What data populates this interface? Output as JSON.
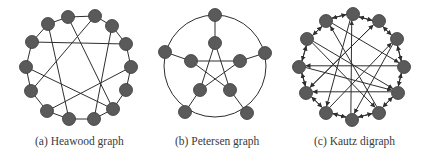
{
  "figure": {
    "panels": [
      {
        "id": "a",
        "caption": "(a)  Heawood graph",
        "graph": "Heawood graph",
        "node_count": 14,
        "nodes": [
          [
            68,
            17
          ],
          [
            95,
            16
          ],
          [
            112,
            26
          ],
          [
            126,
            44
          ],
          [
            131,
            67
          ],
          [
            126,
            90
          ],
          [
            113,
            109
          ],
          [
            94,
            119
          ],
          [
            69,
            119
          ],
          [
            47,
            111
          ],
          [
            31,
            91
          ],
          [
            26,
            67
          ],
          [
            32,
            42
          ],
          [
            48,
            24
          ]
        ],
        "cycle_edges": [
          [
            0,
            1
          ],
          [
            1,
            2
          ],
          [
            2,
            3
          ],
          [
            3,
            4
          ],
          [
            4,
            5
          ],
          [
            5,
            6
          ],
          [
            6,
            7
          ],
          [
            7,
            8
          ],
          [
            8,
            9
          ],
          [
            9,
            10
          ],
          [
            10,
            11
          ],
          [
            11,
            12
          ],
          [
            12,
            13
          ],
          [
            13,
            0
          ]
        ],
        "chord_edges": [
          [
            12,
            3
          ],
          [
            0,
            6
          ],
          [
            1,
            10
          ],
          [
            13,
            8
          ],
          [
            2,
            7
          ],
          [
            11,
            6
          ],
          [
            4,
            9
          ]
        ]
      },
      {
        "id": "b",
        "caption": "(b) Petersen graph",
        "graph": "Petersen graph",
        "node_count": 10,
        "circle": {
          "cx": 215,
          "cy": 66,
          "r": 51
        },
        "outer_nodes": [
          [
            215,
            15
          ],
          [
            265,
            53
          ],
          [
            247,
            113
          ],
          [
            185,
            112
          ],
          [
            165,
            52
          ]
        ],
        "inner_nodes": [
          [
            215,
            43
          ],
          [
            240,
            61
          ],
          [
            230,
            90
          ],
          [
            200,
            90
          ],
          [
            191,
            61
          ]
        ],
        "spokes": [
          [
            0,
            0
          ],
          [
            1,
            1
          ],
          [
            2,
            2
          ],
          [
            3,
            3
          ],
          [
            4,
            4
          ]
        ],
        "star_edges": [
          [
            0,
            2
          ],
          [
            2,
            4
          ],
          [
            4,
            1
          ],
          [
            1,
            3
          ],
          [
            3,
            0
          ]
        ]
      },
      {
        "id": "c",
        "caption": "(c) Kautz digraph",
        "graph": "Kautz digraph",
        "node_count": 12,
        "nodes": [
          [
            353,
            14
          ],
          [
            379,
            21
          ],
          [
            397,
            39
          ],
          [
            404,
            67
          ],
          [
            398,
            93
          ],
          [
            379,
            113
          ],
          [
            352,
            120
          ],
          [
            326,
            113
          ],
          [
            306,
            93
          ],
          [
            299,
            67
          ],
          [
            307,
            39
          ],
          [
            326,
            21
          ]
        ],
        "arcs": [
          [
            0,
            1
          ],
          [
            1,
            0
          ],
          [
            1,
            2
          ],
          [
            2,
            1
          ],
          [
            2,
            3
          ],
          [
            3,
            2
          ],
          [
            3,
            4
          ],
          [
            4,
            3
          ],
          [
            4,
            5
          ],
          [
            5,
            4
          ],
          [
            5,
            6
          ],
          [
            6,
            5
          ],
          [
            6,
            7
          ],
          [
            7,
            6
          ],
          [
            7,
            8
          ],
          [
            8,
            7
          ],
          [
            8,
            9
          ],
          [
            9,
            8
          ],
          [
            9,
            10
          ],
          [
            10,
            9
          ],
          [
            10,
            11
          ],
          [
            11,
            10
          ],
          [
            11,
            0
          ],
          [
            0,
            11
          ],
          [
            10,
            4
          ],
          [
            10,
            5
          ],
          [
            11,
            3
          ],
          [
            0,
            7
          ],
          [
            1,
            8
          ],
          [
            2,
            6
          ],
          [
            9,
            4
          ],
          [
            8,
            1
          ],
          [
            7,
            2
          ],
          [
            6,
            0
          ],
          [
            3,
            9
          ],
          [
            4,
            8
          ],
          [
            5,
            11
          ],
          [
            12,
            0
          ]
        ]
      }
    ],
    "colors": {
      "node_fill": "#5a5a5a",
      "edge": "#2e2e2e",
      "caption": "#3a3a3a"
    }
  }
}
